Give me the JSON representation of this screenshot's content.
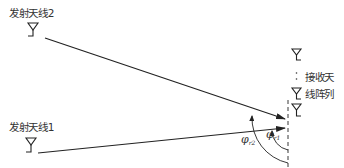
{
  "diagram": {
    "title": "",
    "colors": {
      "stroke": "#222222",
      "text": "#333333",
      "background": "#ffffff"
    },
    "transmitters": [
      {
        "id": "tx2",
        "label": "发射天线2",
        "icon": "antenna-icon"
      },
      {
        "id": "tx1",
        "label": "发射天线1",
        "icon": "antenna-icon"
      }
    ],
    "receiver": {
      "label_line1": "接收天",
      "label_line2": "线阵列",
      "ellipsis": "⋮",
      "element_count_visible": 3,
      "icon": "antenna-icon"
    },
    "angles": [
      {
        "id": "phi_r1",
        "symbol": "φ",
        "subscript": "r1"
      },
      {
        "id": "phi_r2",
        "symbol": "φ",
        "subscript": "r2"
      }
    ],
    "signal_paths": [
      {
        "from": "tx2",
        "to": "receiver",
        "arrow": true
      },
      {
        "from": "tx1",
        "to": "receiver",
        "arrow": true
      }
    ],
    "reference_line": "dashed-vertical-array-axis"
  }
}
